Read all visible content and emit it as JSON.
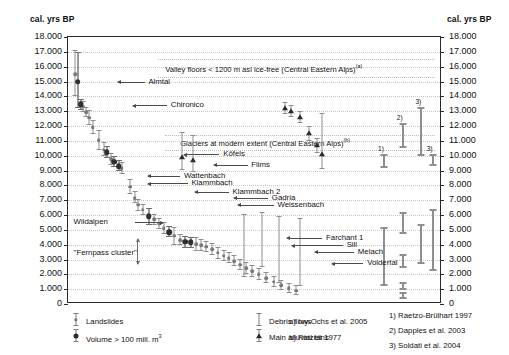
{
  "chart_data": {
    "type": "scatter",
    "title": "",
    "ylabel_left": "cal. yrs BP",
    "ylabel_right": "cal. yrs BP",
    "xlabel": "",
    "ylim": [
      0,
      18000
    ],
    "grid": true,
    "ytick_labels": [
      "18.000",
      "17.000",
      "16.000",
      "15.000",
      "14.000",
      "13.000",
      "12.000",
      "11.000",
      "10.000",
      "9.000",
      "8.000",
      "7.000",
      "6.000",
      "5.000",
      "4.000",
      "3.000",
      "2.000",
      "1.000",
      "0"
    ],
    "ytick_values": [
      18000,
      17000,
      16000,
      15000,
      14000,
      13000,
      12000,
      11000,
      10000,
      9000,
      8000,
      7000,
      6000,
      5000,
      4000,
      3000,
      2000,
      1000,
      0
    ],
    "series": [
      {
        "name": "Landslides",
        "marker": "circle-small",
        "points": [
          {
            "x": 2.0,
            "y": 15500,
            "err_low": 14000,
            "err_high": 17100
          },
          {
            "x": 2.6,
            "y": 15000,
            "err_low": 13200,
            "err_high": 17000
          },
          {
            "x": 3.4,
            "y": 13450,
            "err_low": 13050,
            "err_high": 13850
          },
          {
            "x": 4.0,
            "y": 13300,
            "err_low": 12950,
            "err_high": 13700
          },
          {
            "x": 4.8,
            "y": 12950,
            "err_low": 12600,
            "err_high": 13300
          },
          {
            "x": 5.6,
            "y": 12550,
            "err_low": 12050,
            "err_high": 13050
          },
          {
            "x": 6.6,
            "y": 11900,
            "err_low": 11450,
            "err_high": 12400
          },
          {
            "x": 8.2,
            "y": 11050,
            "err_low": 10350,
            "err_high": 11750
          },
          {
            "x": 9.6,
            "y": 10400,
            "err_low": 9950,
            "err_high": 10900
          },
          {
            "x": 10.4,
            "y": 10250,
            "err_low": 9850,
            "err_high": 10650
          },
          {
            "x": 11.6,
            "y": 9750,
            "err_low": 9350,
            "err_high": 10200
          },
          {
            "x": 12.4,
            "y": 9600,
            "err_low": 9250,
            "err_high": 10000
          },
          {
            "x": 13.6,
            "y": 9300,
            "err_low": 8950,
            "err_high": 9700
          },
          {
            "x": 14.4,
            "y": 9150,
            "err_low": 8750,
            "err_high": 9550
          },
          {
            "x": 16.6,
            "y": 7900,
            "err_low": 7400,
            "err_high": 8400
          },
          {
            "x": 17.8,
            "y": 7150,
            "err_low": 6800,
            "err_high": 7600
          },
          {
            "x": 18.8,
            "y": 6700,
            "err_low": 6300,
            "err_high": 7100
          },
          {
            "x": 20.0,
            "y": 6350,
            "err_low": 6000,
            "err_high": 6750
          },
          {
            "x": 21.6,
            "y": 5900,
            "err_low": 5350,
            "err_high": 6450
          },
          {
            "x": 23.0,
            "y": 5700,
            "err_low": 5350,
            "err_high": 6050
          },
          {
            "x": 24.4,
            "y": 5400,
            "err_low": 5050,
            "err_high": 5800
          },
          {
            "x": 25.6,
            "y": 5100,
            "err_low": 4700,
            "err_high": 5500
          },
          {
            "x": 27.0,
            "y": 4850,
            "err_low": 4500,
            "err_high": 5250
          },
          {
            "x": 28.4,
            "y": 4600,
            "err_low": 4000,
            "err_high": 5200
          },
          {
            "x": 30.0,
            "y": 4300,
            "err_low": 3950,
            "err_high": 4700
          },
          {
            "x": 31.4,
            "y": 4200,
            "err_low": 3800,
            "err_high": 4600
          },
          {
            "x": 32.8,
            "y": 4150,
            "err_low": 3750,
            "err_high": 4550
          },
          {
            "x": 34.2,
            "y": 4050,
            "err_low": 3600,
            "err_high": 4500
          },
          {
            "x": 35.6,
            "y": 3950,
            "err_low": 3600,
            "err_high": 4350
          },
          {
            "x": 37.0,
            "y": 3850,
            "err_low": 3500,
            "err_high": 4250
          },
          {
            "x": 38.6,
            "y": 3700,
            "err_low": 3300,
            "err_high": 4100
          },
          {
            "x": 40.0,
            "y": 3450,
            "err_low": 3050,
            "err_high": 3850
          },
          {
            "x": 41.6,
            "y": 3250,
            "err_low": 2900,
            "err_high": 3650
          },
          {
            "x": 43.0,
            "y": 3100,
            "err_low": 2750,
            "err_high": 3500
          },
          {
            "x": 44.4,
            "y": 2900,
            "err_low": 2550,
            "err_high": 3300
          },
          {
            "x": 46.0,
            "y": 2650,
            "err_low": 2300,
            "err_high": 3050
          },
          {
            "x": 47.6,
            "y": 2400,
            "err_low": 2050,
            "err_high": 2800
          },
          {
            "x": 49.2,
            "y": 2200,
            "err_low": 1850,
            "err_high": 2600
          },
          {
            "x": 51.0,
            "y": 2000,
            "err_low": 1650,
            "err_high": 2400
          },
          {
            "x": 53.0,
            "y": 1750,
            "err_low": 1400,
            "err_high": 2150
          },
          {
            "x": 55.0,
            "y": 1500,
            "err_low": 1150,
            "err_high": 1900
          },
          {
            "x": 57.0,
            "y": 1250,
            "err_low": 950,
            "err_high": 1600
          },
          {
            "x": 59.0,
            "y": 1050,
            "err_low": 750,
            "err_high": 1400
          },
          {
            "x": 61.0,
            "y": 900,
            "err_low": 600,
            "err_high": 1250
          }
        ]
      },
      {
        "name": "Volume > 100 mill. m3",
        "marker": "circle-large",
        "points": [
          {
            "x": 2.6,
            "y": 15000,
            "err_low": 13200,
            "err_high": 17000
          },
          {
            "x": 3.4,
            "y": 13450,
            "err_low": 13050,
            "err_high": 13850
          },
          {
            "x": 10.4,
            "y": 10250,
            "err_low": 9850,
            "err_high": 10650
          },
          {
            "x": 12.4,
            "y": 9600,
            "err_low": 9250,
            "err_high": 10000
          },
          {
            "x": 13.6,
            "y": 9300,
            "err_low": 8950,
            "err_high": 9700
          },
          {
            "x": 21.6,
            "y": 5900,
            "err_low": 5350,
            "err_high": 6450
          },
          {
            "x": 27.0,
            "y": 4850,
            "err_low": 4500,
            "err_high": 5250
          },
          {
            "x": 31.4,
            "y": 4200,
            "err_low": 3800,
            "err_high": 4600
          },
          {
            "x": 32.8,
            "y": 4150,
            "err_low": 3750,
            "err_high": 4550
          }
        ]
      },
      {
        "name": "Debris flows",
        "marker": "bar",
        "points": [
          {
            "x": 47.0,
            "y": 5000,
            "err_low": 1800,
            "err_high": 6100
          },
          {
            "x": 52.0,
            "y": 4000,
            "err_low": 2500,
            "err_high": 6200
          },
          {
            "x": 56.5,
            "y": 3700,
            "err_low": 1400,
            "err_high": 5900
          },
          {
            "x": 62.0,
            "y": 3600,
            "err_low": 1200,
            "err_high": 5800
          }
        ]
      },
      {
        "name": "Main alluvial fans",
        "marker": "triangle",
        "points": [
          {
            "x": 58.0,
            "y": 13200,
            "err_low": 12800,
            "err_high": 13600
          },
          {
            "x": 59.5,
            "y": 13000,
            "err_low": 12600,
            "err_high": 13400
          },
          {
            "x": 62.0,
            "y": 12600,
            "err_low": 12200,
            "err_high": 13000
          },
          {
            "x": 64.5,
            "y": 11500,
            "err_low": 11000,
            "err_high": 12000
          },
          {
            "x": 66.5,
            "y": 10700,
            "err_low": 10200,
            "err_high": 11200
          },
          {
            "x": 68.0,
            "y": 10100,
            "err_low": 9100,
            "err_high": 12900
          },
          {
            "x": 30.5,
            "y": 9900,
            "err_low": 9000,
            "err_high": 11600
          },
          {
            "x": 33.5,
            "y": 9700,
            "err_low": 8900,
            "err_high": 11400
          }
        ]
      }
    ],
    "bands": [
      {
        "id": "valley-floors",
        "label": "Valley floors < 1200 m asl ice-free (Central Eastern Alps)",
        "superscript": "(a)",
        "y_top": 16500,
        "y_bottom": 15300
      },
      {
        "id": "glaciers-modern",
        "label": "Glaciers at modern extent (Central Eastern Alps)",
        "superscript": "(b)",
        "y_top": 11400,
        "y_bottom": 10400
      }
    ],
    "annotations": [
      {
        "label": "Almtal",
        "y": 15000,
        "arrow": "left"
      },
      {
        "label": "Chironico",
        "y": 13400,
        "arrow": "left"
      },
      {
        "label": "Köfels",
        "y": 10100,
        "arrow": "left"
      },
      {
        "label": "Flims",
        "y": 9400,
        "arrow": "left"
      },
      {
        "label": "Wattenbach",
        "y": 8650,
        "arrow": "left"
      },
      {
        "label": "Klammbach",
        "y": 8150,
        "arrow": "left"
      },
      {
        "label": "Klammbach 2",
        "y": 7550,
        "arrow": "left"
      },
      {
        "label": "Gadria",
        "y": 7150,
        "arrow": "left"
      },
      {
        "label": "Weissenbach",
        "y": 6700,
        "arrow": "left"
      },
      {
        "label": "Wildalpen",
        "y": 5500,
        "arrow": "right"
      },
      {
        "label": "\"Fernpass cluster\"",
        "y": 3450,
        "arrow": "vertical"
      },
      {
        "label": "Farchant 1",
        "y": 4450,
        "arrow": "left"
      },
      {
        "label": "Sill",
        "y": 3950,
        "arrow": "left"
      },
      {
        "label": "Melach",
        "y": 3500,
        "arrow": "left"
      },
      {
        "label": "Voldertal",
        "y": 2750,
        "arrow": "left"
      }
    ],
    "reference_bars": [
      {
        "ref": "1)",
        "y_low": 9200,
        "y_high": 10100
      },
      {
        "ref": "2)",
        "y_low": 10500,
        "y_high": 12200
      },
      {
        "ref": "3)",
        "y_low": 10000,
        "y_high": 13300
      },
      {
        "ref": "3)",
        "y_low": 9300,
        "y_high": 10100
      },
      {
        "ref": "",
        "y_low": 1200,
        "y_high": 5200
      },
      {
        "ref": "",
        "y_low": 4700,
        "y_high": 6200
      },
      {
        "ref": "",
        "y_low": 2400,
        "y_high": 3400
      },
      {
        "ref": "",
        "y_low": 950,
        "y_high": 1450
      },
      {
        "ref": "",
        "y_low": 350,
        "y_high": 800
      },
      {
        "ref": "",
        "y_low": 2700,
        "y_high": 5400
      },
      {
        "ref": "",
        "y_low": 2200,
        "y_high": 6400
      }
    ]
  },
  "legend": {
    "items": [
      {
        "id": "landslides",
        "icon": "errorbar-small-dot-icon",
        "label": "Landslides"
      },
      {
        "id": "volume",
        "icon": "errorbar-large-dot-icon",
        "label": "Volume > 100 mill. m",
        "sup": "3"
      },
      {
        "id": "debris-flows",
        "icon": "errorbar-plain-icon",
        "label": "Debris flows"
      },
      {
        "id": "alluvial-fans",
        "icon": "errorbar-triangle-icon",
        "label": "Main alluvial fans"
      }
    ],
    "notes": [
      {
        "key": "a)",
        "text": "Ivy-Ochs et al. 2005"
      },
      {
        "key": "b)",
        "text": "Patzelt 1977"
      }
    ],
    "references": [
      {
        "key": "1)",
        "text": "Raetzo-Brülhart 1997"
      },
      {
        "key": "2)",
        "text": "Dapples et al. 2003"
      },
      {
        "key": "3)",
        "text": "Soldati et al. 2004"
      }
    ]
  },
  "colors": {
    "axis": "#2a2a2a",
    "grid": "#c9c9c9",
    "marker_light": "#7a7a7a",
    "marker_dark": "#2b2b2b",
    "reference": "#8f8f8f",
    "background": "#ffffff"
  }
}
